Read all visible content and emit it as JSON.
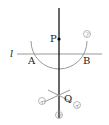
{
  "diagram": {
    "type": "perpendicular-construction",
    "labels": {
      "line": "l",
      "point_p": "P",
      "point_a": "A",
      "point_b": "B",
      "point_q": "Q"
    },
    "step_marks": {
      "arc_top": "ア",
      "arc_left": "イ",
      "arc_right": "イ",
      "line_bottom": "ウ"
    },
    "colors": {
      "line": "#999999",
      "perpendicular": "#000000",
      "arc": "#999999",
      "mark": "#999999"
    }
  }
}
